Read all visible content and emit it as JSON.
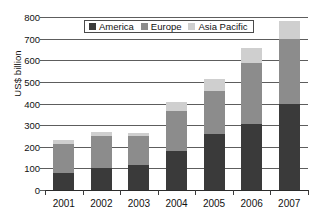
{
  "chart_data": {
    "type": "bar",
    "stacked": true,
    "title": "",
    "subtitle": "",
    "xlabel": "",
    "ylabel": "US$ billion",
    "categories": [
      "2001",
      "2002",
      "2003",
      "2004",
      "2005",
      "2006",
      "2007"
    ],
    "series": [
      {
        "name": "America",
        "color": "#3a3a3a",
        "values": [
          78,
          100,
          115,
          182,
          258,
          305,
          398
        ]
      },
      {
        "name": "Europe",
        "color": "#8c8c8c",
        "values": [
          134,
          148,
          133,
          183,
          202,
          283,
          302
        ]
      },
      {
        "name": "Asia Pacific",
        "color": "#cfcfcf",
        "values": [
          20,
          20,
          17,
          43,
          52,
          67,
          80
        ]
      }
    ],
    "totals": [
      232,
      268,
      265,
      408,
      512,
      655,
      780
    ],
    "ylim": [
      0,
      800
    ],
    "yticks": [
      0,
      100,
      200,
      300,
      400,
      500,
      600,
      700,
      800
    ],
    "ytick_labels": [
      "0",
      "100",
      "200",
      "300",
      "400",
      "500",
      "600",
      "700",
      "800"
    ],
    "grid": true,
    "legend_position": "top-center",
    "legend_entries": [
      "America",
      "Europe",
      "Asia Pacific"
    ]
  },
  "axis": {
    "y_title": "US$ billion"
  },
  "legend": {
    "items": [
      {
        "label": "America"
      },
      {
        "label": "Europe"
      },
      {
        "label": "Asia Pacific"
      }
    ]
  }
}
